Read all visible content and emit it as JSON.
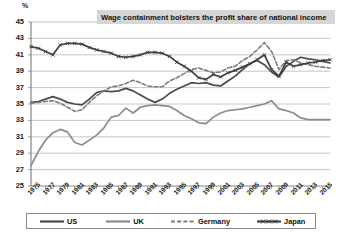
{
  "title": "Wage containment bolsters the profit share of national income",
  "axis_unit": "%",
  "legend": [
    {
      "key": "US",
      "label": "US",
      "color": "#4a4a4a",
      "style": "solid",
      "marker": "none"
    },
    {
      "key": "UK",
      "label": "UK",
      "color": "#8c8c8c",
      "style": "solid",
      "marker": "none"
    },
    {
      "key": "Germany",
      "label": "Germany",
      "color": "#7d7d7d",
      "style": "dashed",
      "marker": "none"
    },
    {
      "key": "Japan",
      "label": "Japan",
      "color": "#3f3f3f",
      "style": "solid",
      "marker": "x"
    }
  ],
  "chart_data": {
    "type": "line",
    "title": "Wage containment bolsters the profit share of national income",
    "xlabel": "",
    "ylabel": "%",
    "ylim": [
      25,
      45
    ],
    "ytick_step": 2,
    "yticks": [
      25,
      27,
      29,
      31,
      33,
      35,
      37,
      39,
      41,
      43,
      45
    ],
    "grid": true,
    "legend_position": "bottom",
    "x": [
      1975,
      1976,
      1977,
      1978,
      1979,
      1980,
      1981,
      1982,
      1983,
      1984,
      1985,
      1986,
      1987,
      1988,
      1989,
      1990,
      1991,
      1992,
      1993,
      1994,
      1995,
      1996,
      1997,
      1998,
      1999,
      2000,
      2001,
      2002,
      2003,
      2004,
      2005,
      2006,
      2007,
      2008,
      2009,
      2010,
      2011,
      2012,
      2013,
      2014,
      2015,
      2016
    ],
    "xtick_labels": [
      "1975",
      "1977",
      "1979",
      "1981",
      "1983",
      "1985",
      "1987",
      "1989",
      "1991",
      "1993",
      "1995",
      "1997",
      "1999",
      "2001",
      "2003",
      "2005",
      "2007",
      "2009",
      "2011",
      "2013",
      "2015"
    ],
    "series": [
      {
        "name": "US",
        "values": [
          35.2,
          35.3,
          35.6,
          35.9,
          35.6,
          35.2,
          35.0,
          34.9,
          35.6,
          36.4,
          36.6,
          36.5,
          36.6,
          36.9,
          36.6,
          36.1,
          35.6,
          35.2,
          35.6,
          36.3,
          36.8,
          37.2,
          37.6,
          37.5,
          37.6,
          37.3,
          37.2,
          37.8,
          38.4,
          39.2,
          39.9,
          40.3,
          39.8,
          38.9,
          38.3,
          39.6,
          40.2,
          40.7,
          40.5,
          40.4,
          40.2,
          40.0
        ]
      },
      {
        "name": "UK",
        "values": [
          27.5,
          29.2,
          30.6,
          31.5,
          31.9,
          31.6,
          30.3,
          30.0,
          30.6,
          31.2,
          32.1,
          33.4,
          33.6,
          34.5,
          33.9,
          34.6,
          34.8,
          34.9,
          34.8,
          34.7,
          34.2,
          33.6,
          33.2,
          32.7,
          32.6,
          33.4,
          33.9,
          34.2,
          34.3,
          34.4,
          34.6,
          34.8,
          35.0,
          35.4,
          34.4,
          34.2,
          33.9,
          33.3,
          33.1,
          33.1,
          33.1,
          33.1
        ]
      },
      {
        "name": "Germany",
        "values": [
          35.1,
          35.2,
          35.3,
          35.4,
          35.1,
          34.6,
          34.1,
          34.3,
          35.2,
          36.0,
          36.6,
          37.1,
          37.2,
          37.5,
          37.9,
          37.6,
          37.2,
          37.1,
          37.1,
          37.8,
          38.2,
          38.7,
          39.2,
          39.4,
          39.1,
          38.8,
          38.9,
          39.4,
          39.6,
          40.3,
          40.8,
          41.6,
          42.5,
          41.4,
          39.2,
          40.3,
          40.4,
          40.0,
          39.8,
          39.6,
          39.5,
          39.4
        ]
      },
      {
        "name": "Japan",
        "values": [
          42.0,
          41.8,
          41.4,
          41.0,
          42.2,
          42.4,
          42.4,
          42.3,
          41.9,
          41.6,
          41.4,
          41.2,
          40.8,
          40.7,
          40.8,
          41.0,
          41.3,
          41.3,
          41.2,
          40.8,
          40.1,
          39.6,
          39.0,
          38.2,
          38.0,
          38.6,
          38.3,
          38.8,
          39.1,
          39.5,
          39.9,
          40.4,
          41.0,
          39.2,
          38.4,
          40.1,
          39.6,
          39.8,
          40.0,
          40.1,
          40.3,
          40.4
        ]
      }
    ]
  }
}
